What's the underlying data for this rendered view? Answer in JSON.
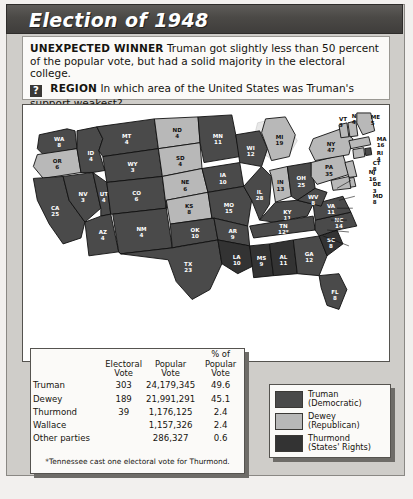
{
  "banner": {
    "title": "Election of 1948"
  },
  "caption": {
    "winner_label": "UNEXPECTED WINNER",
    "winner_text": "Truman got slightly less than 50 percent of the popular vote, but had a solid majority in the electoral college.",
    "badge_glyph": "?",
    "region_label": "REGION",
    "region_text": "In which area of the United States was Truman's support weakest?"
  },
  "table": {
    "headers": {
      "party": "",
      "electoral": "Electoral\nVote",
      "popular": "Popular\nVote",
      "percent": "% of\nPopular Vote"
    },
    "rows": [
      {
        "party": "Truman",
        "electoral": "303",
        "popular": "24,179,345",
        "percent": "49.6"
      },
      {
        "party": "Dewey",
        "electoral": "189",
        "popular": "21,991,291",
        "percent": "45.1"
      },
      {
        "party": "Thurmond",
        "electoral": "39",
        "popular": "1,176,125",
        "percent": "2.4"
      },
      {
        "party": "Wallace",
        "electoral": "",
        "popular": "1,157,326",
        "percent": "2.4"
      },
      {
        "party": "Other parties",
        "electoral": "",
        "popular": "286,327",
        "percent": "0.6"
      }
    ],
    "note": "*Tennessee cast one electoral vote for Thurmond."
  },
  "legend": {
    "items": [
      {
        "label": "Truman\n(Democratic)",
        "color": "#4a4a4a"
      },
      {
        "label": "Dewey\n(Republican)",
        "color": "#b8b8b8"
      },
      {
        "label": "Thurmond\n(States' Rights)",
        "color": "#333333"
      }
    ]
  },
  "colors": {
    "truman": "#4a4a4a",
    "dewey": "#b8b8b8",
    "thurmond": "#333333",
    "water": "#e8e8e8"
  },
  "map_data": {
    "type": "choropleth",
    "title": "1948 United States presidential election results by state",
    "states": [
      {
        "code": "WA",
        "ev": "8",
        "winner": "truman"
      },
      {
        "code": "OR",
        "ev": "6",
        "winner": "dewey"
      },
      {
        "code": "CA",
        "ev": "25",
        "winner": "truman"
      },
      {
        "code": "ID",
        "ev": "4",
        "winner": "truman"
      },
      {
        "code": "NV",
        "ev": "3",
        "winner": "truman"
      },
      {
        "code": "UT",
        "ev": "4",
        "winner": "truman"
      },
      {
        "code": "AZ",
        "ev": "4",
        "winner": "truman"
      },
      {
        "code": "MT",
        "ev": "4",
        "winner": "truman"
      },
      {
        "code": "WY",
        "ev": "3",
        "winner": "truman"
      },
      {
        "code": "CO",
        "ev": "6",
        "winner": "truman"
      },
      {
        "code": "NM",
        "ev": "4",
        "winner": "truman"
      },
      {
        "code": "ND",
        "ev": "4",
        "winner": "dewey"
      },
      {
        "code": "SD",
        "ev": "4",
        "winner": "dewey"
      },
      {
        "code": "NE",
        "ev": "6",
        "winner": "dewey"
      },
      {
        "code": "KS",
        "ev": "8",
        "winner": "dewey"
      },
      {
        "code": "OK",
        "ev": "10",
        "winner": "truman"
      },
      {
        "code": "TX",
        "ev": "23",
        "winner": "truman"
      },
      {
        "code": "MN",
        "ev": "11",
        "winner": "truman"
      },
      {
        "code": "IA",
        "ev": "10",
        "winner": "truman"
      },
      {
        "code": "MO",
        "ev": "15",
        "winner": "truman"
      },
      {
        "code": "AR",
        "ev": "9",
        "winner": "truman"
      },
      {
        "code": "LA",
        "ev": "10",
        "winner": "thurmond"
      },
      {
        "code": "WI",
        "ev": "12",
        "winner": "truman"
      },
      {
        "code": "IL",
        "ev": "28",
        "winner": "truman"
      },
      {
        "code": "MI",
        "ev": "19",
        "winner": "dewey"
      },
      {
        "code": "IN",
        "ev": "13",
        "winner": "dewey"
      },
      {
        "code": "OH",
        "ev": "25",
        "winner": "truman"
      },
      {
        "code": "KY",
        "ev": "11",
        "winner": "truman"
      },
      {
        "code": "TN",
        "ev": "12*",
        "winner": "truman"
      },
      {
        "code": "MS",
        "ev": "9",
        "winner": "thurmond"
      },
      {
        "code": "AL",
        "ev": "11",
        "winner": "thurmond"
      },
      {
        "code": "GA",
        "ev": "12",
        "winner": "truman"
      },
      {
        "code": "FL",
        "ev": "8",
        "winner": "truman"
      },
      {
        "code": "SC",
        "ev": "8",
        "winner": "thurmond"
      },
      {
        "code": "NC",
        "ev": "14",
        "winner": "truman"
      },
      {
        "code": "VA",
        "ev": "11",
        "winner": "truman"
      },
      {
        "code": "WV",
        "ev": "8",
        "winner": "truman"
      },
      {
        "code": "PA",
        "ev": "35",
        "winner": "dewey"
      },
      {
        "code": "NY",
        "ev": "47",
        "winner": "dewey"
      },
      {
        "code": "VT",
        "ev": "3",
        "winner": "dewey"
      },
      {
        "code": "NH",
        "ev": "4",
        "winner": "dewey"
      },
      {
        "code": "ME",
        "ev": "5",
        "winner": "dewey"
      },
      {
        "code": "MA",
        "ev": "16",
        "winner": "dewey"
      },
      {
        "code": "RI",
        "ev": "4",
        "winner": "truman"
      },
      {
        "code": "CT",
        "ev": "8",
        "winner": "dewey"
      },
      {
        "code": "NJ",
        "ev": "16",
        "winner": "dewey"
      },
      {
        "code": "DE",
        "ev": "3",
        "winner": "dewey"
      },
      {
        "code": "MD",
        "ev": "8",
        "winner": "dewey"
      }
    ]
  }
}
